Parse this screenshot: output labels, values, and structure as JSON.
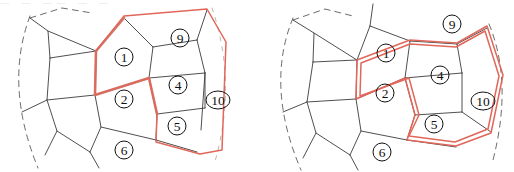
{
  "figure": {
    "title": "",
    "panel_count": 2,
    "colors": {
      "cell_stroke": "#3b3b3b",
      "dashed_stroke": "#5a5a5a",
      "highlight_red": "#e0675a",
      "highlight_red_thick": "#cf7a6e",
      "background": "#ffffff"
    },
    "top_cutoff_text": "—  —   ——  — —"
  },
  "panels": [
    {
      "id": "left",
      "name": "left-tiling-diagram",
      "labels": [
        {
          "id": "l1",
          "text": "1",
          "x": 124,
          "y": 57,
          "rx": 9,
          "ry": 9
        },
        {
          "id": "l9",
          "text": "9",
          "x": 180,
          "y": 38,
          "rx": 9,
          "ry": 9
        },
        {
          "id": "l2",
          "text": "2",
          "x": 124,
          "y": 99,
          "rx": 9,
          "ry": 9
        },
        {
          "id": "l4",
          "text": "4",
          "x": 178,
          "y": 85,
          "rx": 9,
          "ry": 9
        },
        {
          "id": "l10",
          "text": "10",
          "x": 218,
          "y": 100,
          "rx": 12,
          "ry": 9
        },
        {
          "id": "l5",
          "text": "5",
          "x": 177,
          "y": 126,
          "rx": 9,
          "ry": 9
        },
        {
          "id": "l6",
          "text": "6",
          "x": 124,
          "y": 150,
          "rx": 9,
          "ry": 9
        }
      ],
      "cell_edges": [
        "M 30 18 L 48 31 L 50 58",
        "M 50 58 L 96 51",
        "M 48 31 L 96 51",
        "M 50 58 L 47 100 L 22 112",
        "M 47 100 L 95 95",
        "M 96 51 L 95 95",
        "M 95 95 L 101 127 L 90 152",
        "M 47 100 L 57 131 L 45 155",
        "M 57 131 L 90 152",
        "M 90 152 L 99 168",
        "M 96 51 L 124 18",
        "M 124 18 L 153 47",
        "M 153 47 L 149 78",
        "M 95 95 L 149 78",
        "M 153 47 L 197 40",
        "M 197 40 L 205 73",
        "M 149 78 L 205 73",
        "M 205 73 L 201 130",
        "M 149 78 L 157 114",
        "M 157 114 L 205 108",
        "M 157 114 L 156 140",
        "M 101 127 L 156 140",
        "M 156 140 L 197 152",
        "M 197 40 L 207 10",
        "M 205 108 L 205 73"
      ],
      "red_thick_edges": [
        "M 96 51 L 124 18",
        "M 96 51 L 95 95",
        "M 95 95 L 149 78",
        "M 149 78 L 157 114"
      ],
      "red_boundary": "M 124 16 L 207 9 L 226 42 L 222 150 L 200 154 L 156 142 L 157 114 L 149 78 L 95 95 L 96 51 Z",
      "red_outer_only": "M 124 16 L 207 9 L 226 42 L 222 150 L 200 154 L 157 141",
      "dashed_arcs": [
        {
          "d": "M 30 16 Q 4 85 38 168",
          "faint": false
        },
        {
          "d": "M 212 8 Q 238 84 214 165",
          "faint": true
        },
        {
          "d": "M 30 18 L 62 8 L 92 13",
          "faint": false
        }
      ]
    },
    {
      "id": "right",
      "name": "right-tiling-diagram",
      "labels": [
        {
          "id": "r1",
          "text": "1",
          "x": 129,
          "y": 53,
          "rx": 9,
          "ry": 9
        },
        {
          "id": "r9",
          "text": "9",
          "x": 195,
          "y": 24,
          "rx": 9,
          "ry": 9
        },
        {
          "id": "r2",
          "text": "2",
          "x": 128,
          "y": 93,
          "rx": 9,
          "ry": 9
        },
        {
          "id": "r4",
          "text": "4",
          "x": 183,
          "y": 75,
          "rx": 9,
          "ry": 9
        },
        {
          "id": "r10",
          "text": "10",
          "x": 226,
          "y": 101,
          "rx": 12,
          "ry": 9
        },
        {
          "id": "r5",
          "text": "5",
          "x": 177,
          "y": 124,
          "rx": 9,
          "ry": 9
        },
        {
          "id": "r6",
          "text": "6",
          "x": 125,
          "y": 152,
          "rx": 9,
          "ry": 9
        }
      ],
      "cell_edges": [
        "M 36 20 L 57 33 L 56 62",
        "M 56 62 L 100 60",
        "M 57 33 L 100 60",
        "M 56 62 L 50 102 L 26 112",
        "M 50 102 L 99 99",
        "M 100 60 L 99 99",
        "M 99 99 L 104 131 L 93 155",
        "M 50 102 L 59 133 L 46 158",
        "M 59 133 L 93 155",
        "M 93 155 L 101 170",
        "M 100 60 L 113 26",
        "M 113 26 L 153 41",
        "M 153 41 L 148 78",
        "M 99 99 L 148 78",
        "M 153 41 L 200 44",
        "M 200 44 L 205 73",
        "M 148 78 L 205 73",
        "M 205 73 L 205 112",
        "M 148 78 L 158 115",
        "M 158 115 L 205 112",
        "M 158 115 L 150 140",
        "M 104 131 L 150 140",
        "M 150 140 L 199 147",
        "M 113 26 L 116 4",
        "M 200 44 L 230 28",
        "M 205 112 L 234 132"
      ],
      "red_boundary": "M 153 40 L 200 43 L 230 26 L 246 75 L 234 133 L 199 146 L 150 140 L 158 115 L 148 78 L 99 99 L 100 60 Z",
      "red_inner_offset": "M 153 44 L 199 47 L 228 31 L 242 76 L 231 129 L 198 142 L 152 136 L 162 115 L 152 78 L 103 96 L 104 63 Z",
      "dashed_arcs": [
        {
          "d": "M 36 18 Q 8 86 44 170",
          "faint": false
        },
        {
          "d": "M 232 24 Q 256 82 236 160",
          "faint": false
        },
        {
          "d": "M 36 20 L 68 9 L 96 16",
          "faint": false
        }
      ]
    }
  ]
}
